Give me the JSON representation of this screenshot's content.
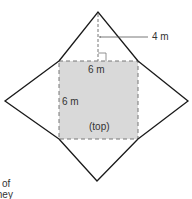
{
  "diagram": {
    "labels": {
      "slant_height": "4 m",
      "base_width": "6 m",
      "base_height": "6 m",
      "face_label": "(top)"
    },
    "cutoff_text": [
      "of",
      "they"
    ],
    "colors": {
      "square_fill": "#d9d9d9",
      "stroke": "#1a1a1a",
      "dashed": "#777777",
      "text": "#333333"
    }
  }
}
